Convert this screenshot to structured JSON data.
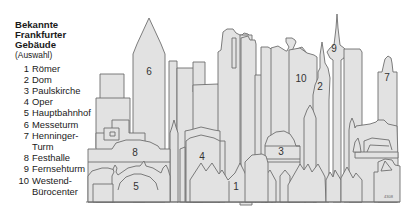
{
  "legend": {
    "title_lines": [
      "Bekannte",
      "Frankfurter",
      "Gebäude"
    ],
    "subtitle": "(Auswahl)",
    "items": [
      {
        "num": "1",
        "lines": [
          "Römer"
        ]
      },
      {
        "num": "2",
        "lines": [
          "Dom"
        ]
      },
      {
        "num": "3",
        "lines": [
          "Paulskirche"
        ]
      },
      {
        "num": "4",
        "lines": [
          "Oper"
        ]
      },
      {
        "num": "5",
        "lines": [
          "Hauptbahnhof"
        ]
      },
      {
        "num": "6",
        "lines": [
          "Messeturm"
        ]
      },
      {
        "num": "7",
        "lines": [
          "Henninger-",
          "Turm"
        ]
      },
      {
        "num": "8",
        "lines": [
          "Festhalle"
        ]
      },
      {
        "num": "9",
        "lines": [
          "Fernsehturm"
        ]
      },
      {
        "num": "10",
        "lines": [
          "Westend-",
          "Bürocenter"
        ]
      }
    ]
  },
  "skyline": {
    "labels": {
      "b1": "1",
      "b2": "2",
      "b3": "3",
      "b4": "4",
      "b5": "5",
      "b6": "6",
      "b7": "7",
      "b8": "8",
      "b9": "9",
      "b10": "10"
    },
    "code": "4308",
    "colors": {
      "fill": "#e2e2e2",
      "stroke": "#6e6e6e"
    }
  }
}
